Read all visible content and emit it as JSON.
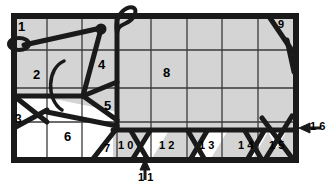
{
  "figure": {
    "background_color": "#ffffff",
    "line_color": "#1a1a1a",
    "shade_color": "#d4d4d4",
    "unshaded_color": "#ffffff"
  },
  "labels": [
    {
      "id": "ref-1",
      "text": "1",
      "x": 18,
      "y": 20
    },
    {
      "id": "ref-2",
      "text": "2",
      "x": 33,
      "y": 68
    },
    {
      "id": "ref-3",
      "text": "3",
      "x": 15,
      "y": 118
    },
    {
      "id": "ref-4",
      "text": "4",
      "x": 98,
      "y": 62
    },
    {
      "id": "ref-5",
      "text": "5",
      "x": 104,
      "y": 103
    },
    {
      "id": "ref-6",
      "text": "6",
      "x": 64,
      "y": 134
    },
    {
      "id": "ref-7",
      "text": "7",
      "x": 104,
      "y": 147
    },
    {
      "id": "ref-8",
      "text": "8",
      "x": 163,
      "y": 70
    },
    {
      "id": "ref-9",
      "text": "9",
      "x": 278,
      "y": 19
    },
    {
      "id": "ref-10",
      "text": "1 0",
      "x": 119,
      "y": 143
    },
    {
      "id": "ref-11",
      "text": "1 1",
      "x": 139,
      "y": 174
    },
    {
      "id": "ref-12",
      "text": "1 2",
      "x": 160,
      "y": 143
    },
    {
      "id": "ref-13",
      "text": "1 3",
      "x": 200,
      "y": 143
    },
    {
      "id": "ref-14",
      "text": "1 4",
      "x": 239,
      "y": 143
    },
    {
      "id": "ref-15",
      "text": "1 5",
      "x": 270,
      "y": 143
    },
    {
      "id": "ref-16",
      "text": "1 6",
      "x": 311,
      "y": 124
    }
  ],
  "leaders": [
    {
      "id": "leader-11",
      "points_to": "1 1",
      "direction": "up"
    },
    {
      "id": "leader-16",
      "points_to": "1 6",
      "direction": "left"
    }
  ],
  "markers": [
    {
      "id": "dot-marker",
      "shape": "filled-circle",
      "x": 100,
      "y": 29
    },
    {
      "id": "loop-top",
      "shape": "open-loop",
      "x": 123,
      "y": 10
    },
    {
      "id": "loop-left",
      "shape": "open-loop",
      "x": 19,
      "y": 44
    },
    {
      "id": "arc-curve",
      "shape": "c-arc",
      "x": 60,
      "y": 85
    }
  ]
}
